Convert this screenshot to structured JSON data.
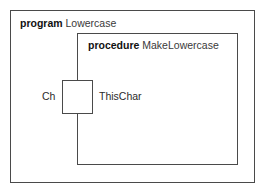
{
  "diagram": {
    "type": "nassi-shneiderman-scope-diagram",
    "program": {
      "keyword": "program",
      "name": "Lowercase"
    },
    "procedure": {
      "keyword": "procedure",
      "name": "MakeLowercase"
    },
    "parameter": {
      "actual_label": "Ch",
      "formal_label": "ThisChar",
      "box_label": ""
    },
    "colors": {
      "background": "#ffffff",
      "stroke": "#4a4a4a",
      "keyword_text": "#111111",
      "name_text": "#3a3a3a",
      "label_text": "#2b2b2b"
    }
  }
}
